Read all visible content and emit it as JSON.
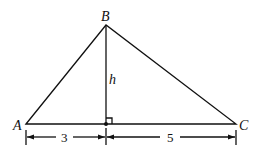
{
  "diagram": {
    "type": "triangle-with-altitude",
    "vertices": {
      "A": "A",
      "B": "B",
      "C": "C"
    },
    "altitude_label": "h",
    "segments": {
      "left": "3",
      "right": "5"
    },
    "right_angle_marker": true,
    "stroke_color": "#111111",
    "background": "#ffffff"
  }
}
